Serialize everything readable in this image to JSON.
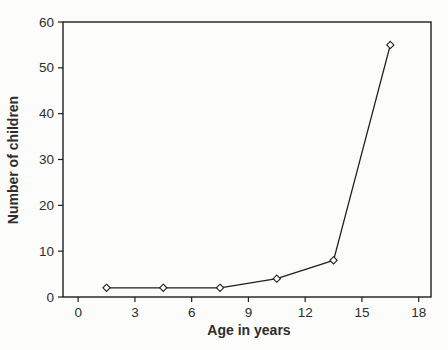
{
  "figure": {
    "background_color": "#fcfcfa",
    "axis_color": "#1e1e1e",
    "text_color": "#2d2d2d",
    "marker_fill": "#ffffff"
  },
  "chart_data": {
    "type": "line",
    "title": "",
    "xlabel": "Age in years",
    "ylabel": "Number of children",
    "series": [
      {
        "name": "number-of-children-by-age",
        "x": [
          1.5,
          4.5,
          7.5,
          10.5,
          13.5,
          16.5
        ],
        "y": [
          2,
          2,
          2,
          4,
          8,
          55
        ]
      }
    ],
    "xticks": [
      0,
      3,
      6,
      9,
      12,
      15,
      18
    ],
    "yticks": [
      0,
      10,
      20,
      30,
      40,
      50,
      60
    ],
    "xlim": [
      -0.8,
      18.65
    ],
    "ylim": [
      0,
      60
    ],
    "marker": "open-diamond",
    "grid": false,
    "legend_position": "none"
  }
}
